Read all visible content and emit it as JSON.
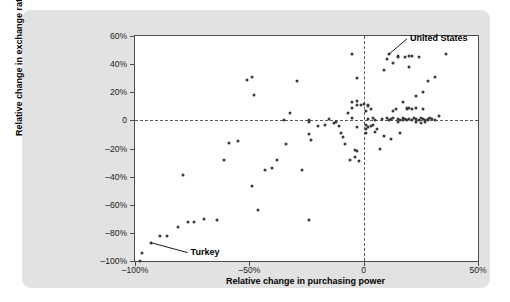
{
  "chart_data": {
    "type": "scatter",
    "title": "",
    "xlabel": "Relative change in purchasing power",
    "ylabel": "Relative change in exchange rate",
    "xlim": [
      -100,
      50
    ],
    "ylim": [
      -100,
      60
    ],
    "grid": false,
    "legend": null,
    "xticks": [
      {
        "value": -100,
        "label": "–100%"
      },
      {
        "value": -50,
        "label": "–50%"
      },
      {
        "value": 0,
        "label": "0"
      },
      {
        "value": 50,
        "label": "50%"
      }
    ],
    "yticks": [
      {
        "value": 60,
        "label": "60%"
      },
      {
        "value": 40,
        "label": "40%"
      },
      {
        "value": 20,
        "label": "20%"
      },
      {
        "value": 0,
        "label": "0"
      },
      {
        "value": -20,
        "label": "–20%"
      },
      {
        "value": -40,
        "label": "–40%"
      },
      {
        "value": -60,
        "label": "–60%"
      },
      {
        "value": -80,
        "label": "–80%"
      },
      {
        "value": -100,
        "label": "–100%"
      }
    ],
    "reference_lines": [
      {
        "orientation": "horizontal",
        "value": 0,
        "style": "dashed"
      },
      {
        "orientation": "vertical",
        "value": 0,
        "style": "dashed"
      }
    ],
    "annotations": [
      {
        "id": "united-states",
        "label": "United States",
        "point": [
          11,
          47
        ],
        "text_x": 19,
        "text_y": 58
      },
      {
        "id": "turkey",
        "label": "Turkey",
        "point": [
          -93,
          -87
        ],
        "text_x": -77,
        "text_y": -94
      }
    ],
    "points": [
      [
        -98,
        -100
      ],
      [
        -97,
        -94
      ],
      [
        -93,
        -87
      ],
      [
        -89,
        -82
      ],
      [
        -86,
        -82
      ],
      [
        -81,
        -76
      ],
      [
        -77,
        -72
      ],
      [
        -74,
        -72
      ],
      [
        -79,
        -39
      ],
      [
        -70,
        -70
      ],
      [
        -64,
        -71
      ],
      [
        -61,
        -28
      ],
      [
        -59,
        -16
      ],
      [
        -55,
        -15
      ],
      [
        -51,
        29
      ],
      [
        -49,
        31
      ],
      [
        -49,
        -47
      ],
      [
        -48,
        18
      ],
      [
        -46,
        -64
      ],
      [
        -43,
        -35
      ],
      [
        -40,
        -34
      ],
      [
        -38,
        -28
      ],
      [
        -35,
        0
      ],
      [
        -34,
        -17
      ],
      [
        -32,
        5
      ],
      [
        -29,
        28
      ],
      [
        -27,
        -35
      ],
      [
        -24,
        0
      ],
      [
        -24,
        -1
      ],
      [
        -24,
        -10
      ],
      [
        -24,
        -71
      ],
      [
        -23,
        -14
      ],
      [
        -20,
        -4
      ],
      [
        -17,
        -3
      ],
      [
        -15,
        1
      ],
      [
        -13,
        -2
      ],
      [
        -12,
        -1
      ],
      [
        -11,
        -4
      ],
      [
        -10,
        -9
      ],
      [
        -9,
        -12
      ],
      [
        -8,
        -17
      ],
      [
        -7,
        5
      ],
      [
        -6,
        -28
      ],
      [
        -5,
        47
      ],
      [
        -5,
        13
      ],
      [
        -5,
        9
      ],
      [
        -5,
        2
      ],
      [
        -4,
        -21
      ],
      [
        -4,
        -26
      ],
      [
        -3,
        30
      ],
      [
        -3,
        14
      ],
      [
        -3,
        11
      ],
      [
        -3,
        -5
      ],
      [
        -3,
        -22
      ],
      [
        -2,
        -29
      ],
      [
        -1,
        11
      ],
      [
        0,
        12
      ],
      [
        1,
        7
      ],
      [
        1,
        -3
      ],
      [
        1,
        -6
      ],
      [
        1,
        -9
      ],
      [
        2,
        11
      ],
      [
        2,
        10
      ],
      [
        2,
        1
      ],
      [
        2,
        -5
      ],
      [
        3,
        8
      ],
      [
        3,
        -4
      ],
      [
        4,
        2
      ],
      [
        4,
        -3
      ],
      [
        5,
        0
      ],
      [
        5,
        -8
      ],
      [
        6,
        -6
      ],
      [
        7,
        -20
      ],
      [
        8,
        1
      ],
      [
        9,
        36
      ],
      [
        9,
        -11
      ],
      [
        10,
        44
      ],
      [
        10,
        2
      ],
      [
        11,
        47
      ],
      [
        11,
        0
      ],
      [
        12,
        1
      ],
      [
        12,
        -13
      ],
      [
        13,
        41
      ],
      [
        13,
        7
      ],
      [
        13,
        2
      ],
      [
        14,
        8
      ],
      [
        15,
        46
      ],
      [
        15,
        45
      ],
      [
        15,
        1
      ],
      [
        15,
        -1
      ],
      [
        16,
        0
      ],
      [
        16,
        -9
      ],
      [
        17,
        13
      ],
      [
        17,
        2
      ],
      [
        17,
        0
      ],
      [
        18,
        45
      ],
      [
        18,
        1
      ],
      [
        19,
        9
      ],
      [
        19,
        8
      ],
      [
        19,
        0
      ],
      [
        20,
        46
      ],
      [
        20,
        38
      ],
      [
        20,
        9
      ],
      [
        20,
        1
      ],
      [
        21,
        46
      ],
      [
        21,
        8
      ],
      [
        21,
        0
      ],
      [
        22,
        2
      ],
      [
        23,
        17
      ],
      [
        23,
        9
      ],
      [
        23,
        1
      ],
      [
        23,
        -1
      ],
      [
        24,
        45
      ],
      [
        24,
        0
      ],
      [
        25,
        2
      ],
      [
        25,
        -2
      ],
      [
        26,
        20
      ],
      [
        26,
        8
      ],
      [
        26,
        1
      ],
      [
        27,
        0
      ],
      [
        27,
        -1
      ],
      [
        28,
        28
      ],
      [
        28,
        1
      ],
      [
        28,
        0
      ],
      [
        29,
        2
      ],
      [
        30,
        1
      ],
      [
        31,
        31
      ],
      [
        31,
        0
      ],
      [
        33,
        3
      ],
      [
        36,
        47
      ]
    ]
  }
}
